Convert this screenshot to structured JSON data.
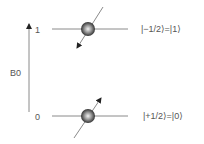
{
  "diagram": {
    "axis": {
      "label": "B0",
      "top_level_label": "1",
      "bottom_level_label": "0"
    },
    "levels": [
      {
        "name": "upper",
        "level_value": "1",
        "state_label": "|−1/2⟩=|1⟩",
        "spin_direction": "down"
      },
      {
        "name": "lower",
        "level_value": "0",
        "state_label": "|+1/2⟩=|0⟩",
        "spin_direction": "up"
      }
    ],
    "colors": {
      "line": "#8a8a8a",
      "text": "#555555",
      "sphere_dark": "#222222",
      "sphere_light": "#e8e8e8",
      "arrow": "#333333"
    }
  }
}
